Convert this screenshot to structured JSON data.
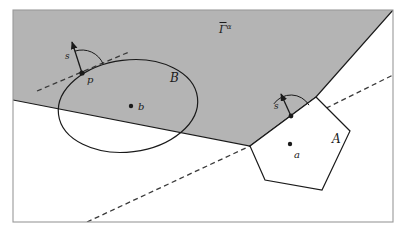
{
  "figure": {
    "width": 406,
    "height": 237,
    "background_color": "#ffffff",
    "frame_color": "#9a9a9a",
    "shade_color": "#b4b4b4",
    "stroke_color": "#1a1a1a",
    "dash_color": "#3a3a3a"
  },
  "labels": {
    "gamma_region": "Γ̅ᵅ",
    "gamma_region_plain": "Gamma-bar alpha",
    "set_b": "B",
    "set_a": "A",
    "point_b": "b",
    "point_a": "a",
    "point_p": "p",
    "vector_s_left": "s",
    "vector_s_right": "s"
  },
  "geometry": {
    "frame": {
      "x": 13,
      "y": 10,
      "width": 380,
      "height": 212
    },
    "shaded_polygon_points": "13,100 250,146 316,97 393,10 13,10",
    "ellipse": {
      "cx": 128,
      "cy": 106,
      "rx": 70,
      "ry": 46,
      "rotation": -7
    },
    "polygon_a_points": "316,97 350,131 322,190 265,180 250,146",
    "point_b": {
      "x": 131,
      "y": 106
    },
    "point_a": {
      "x": 290,
      "y": 144
    },
    "point_p": {
      "x": 82,
      "y": 73
    },
    "vector_s_left": {
      "x1": 82,
      "y1": 73,
      "x2": 72,
      "y2": 42
    },
    "vector_s_right": {
      "x1": 291,
      "y1": 116,
      "x2": 281,
      "y2": 94
    },
    "tangent_dash_left": {
      "x1": 37,
      "y1": 91,
      "x2": 129,
      "y2": 52
    },
    "long_dash": {
      "x1": 87,
      "y1": 222,
      "x2": 250,
      "y2": 146
    },
    "upper_dash": {
      "x1": 250,
      "y1": 146,
      "x2": 393,
      "y2": 75
    },
    "arc_left": {
      "cx": 82,
      "cy": 73,
      "r": 23
    },
    "arc_right": {
      "cx": 291,
      "cy": 116,
      "r": 21
    }
  },
  "label_positions": {
    "gamma_region": {
      "x": 219,
      "y": 33
    },
    "set_b": {
      "x": 170,
      "y": 82
    },
    "set_a": {
      "x": 332,
      "y": 143
    },
    "point_b": {
      "x": 138,
      "y": 110
    },
    "point_a": {
      "x": 294,
      "y": 158
    },
    "point_p": {
      "x": 87,
      "y": 83
    },
    "vector_s_left": {
      "x": 65,
      "y": 59
    },
    "vector_s_right": {
      "x": 274,
      "y": 109
    }
  }
}
